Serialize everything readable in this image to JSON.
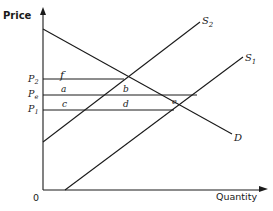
{
  "diagram": {
    "axes": {
      "y_label": "Price",
      "x_label": "Quantity",
      "origin_label": "0"
    },
    "curves": {
      "demand": "D",
      "supply_1_main": "S",
      "supply_1_sub": "1",
      "supply_2_main": "S",
      "supply_2_sub": "2"
    },
    "price_levels": {
      "p2_main": "P",
      "p2_sub": "2",
      "pe_main": "P",
      "pe_sub": "e",
      "p1_main": "P",
      "p1_sub": "1"
    },
    "regions": {
      "f": "f",
      "a": "a",
      "b": "b",
      "c": "c",
      "d": "d",
      "e": "e"
    },
    "colors": {
      "line": "#1a1a1a",
      "background": "#ffffff"
    }
  }
}
